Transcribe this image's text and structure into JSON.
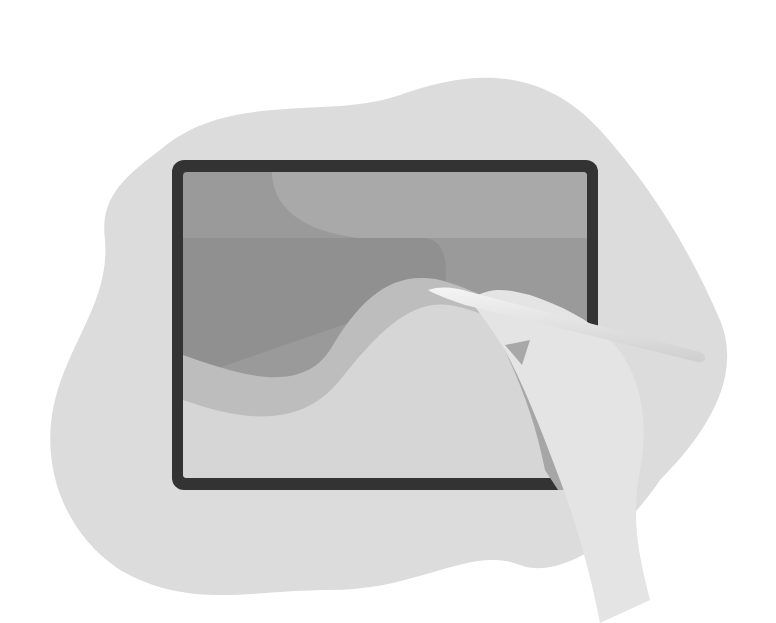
{
  "illustration": {
    "subject": "hand drawing on tablet with stylus",
    "colors": {
      "background": "#ffffff",
      "blob": "#dcdcdc",
      "tablet_frame": "#333333",
      "screen_top": "#9a9a9a",
      "screen_shape_light": "#a9a9a9",
      "screen_shape_dark": "#8e8e8e",
      "wave_mid": "#bdbdbd",
      "screen_bottom": "#d6d6d6",
      "hand": "#e4e4e4",
      "hand_shadow": "#a0a0a0",
      "stylus": "#ececec"
    }
  }
}
